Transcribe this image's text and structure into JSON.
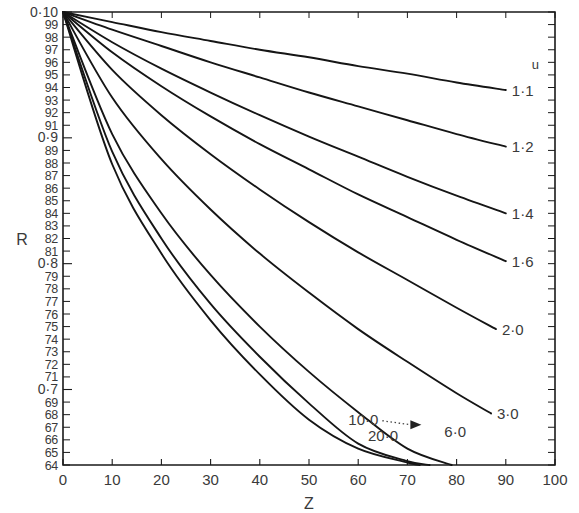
{
  "chart_data": {
    "type": "line",
    "title": "",
    "xlabel": "Z",
    "ylabel": "R",
    "xlim": [
      0,
      100
    ],
    "ylim": [
      0.64,
      1.0
    ],
    "grid": false,
    "legend_position": "inline-right",
    "x_ticks": [
      0,
      10,
      20,
      30,
      40,
      50,
      60,
      70,
      80,
      90,
      100
    ],
    "x_tick_labels": [
      "0",
      "10",
      "20",
      "30",
      "40",
      "50",
      "60",
      "70",
      "80",
      "90",
      "100"
    ],
    "y_ticks": [
      1.0,
      0.99,
      0.98,
      0.97,
      0.96,
      0.95,
      0.94,
      0.93,
      0.92,
      0.91,
      0.9,
      0.89,
      0.88,
      0.87,
      0.86,
      0.85,
      0.84,
      0.83,
      0.82,
      0.81,
      0.8,
      0.79,
      0.78,
      0.77,
      0.76,
      0.75,
      0.74,
      0.73,
      0.72,
      0.71,
      0.7,
      0.69,
      0.68,
      0.67,
      0.66,
      0.65,
      0.64
    ],
    "y_tick_labels": [
      "0·10",
      "99",
      "98",
      "97",
      "96",
      "95",
      "94",
      "93",
      "92",
      "91",
      "0·9",
      "89",
      "88",
      "87",
      "86",
      "85",
      "84",
      "83",
      "82",
      "81",
      "0·8",
      "79",
      "78",
      "77",
      "76",
      "75",
      "74",
      "73",
      "72",
      "71",
      "0·7",
      "69",
      "68",
      "67",
      "66",
      "65",
      "64"
    ],
    "series_param_name": "u",
    "series": [
      {
        "name": "1·1",
        "label_position": "right",
        "points": [
          [
            0,
            1.0
          ],
          [
            10,
            0.992
          ],
          [
            20,
            0.984
          ],
          [
            30,
            0.977
          ],
          [
            40,
            0.97
          ],
          [
            50,
            0.964
          ],
          [
            60,
            0.957
          ],
          [
            70,
            0.951
          ],
          [
            80,
            0.944
          ],
          [
            90,
            0.938
          ]
        ]
      },
      {
        "name": "1·2",
        "label_position": "right",
        "points": [
          [
            0,
            1.0
          ],
          [
            10,
            0.986
          ],
          [
            20,
            0.973
          ],
          [
            30,
            0.96
          ],
          [
            40,
            0.948
          ],
          [
            50,
            0.936
          ],
          [
            60,
            0.925
          ],
          [
            70,
            0.914
          ],
          [
            80,
            0.903
          ],
          [
            90,
            0.893
          ]
        ]
      },
      {
        "name": "1·4",
        "label_position": "right",
        "points": [
          [
            0,
            1.0
          ],
          [
            10,
            0.976
          ],
          [
            20,
            0.955
          ],
          [
            30,
            0.936
          ],
          [
            40,
            0.918
          ],
          [
            50,
            0.901
          ],
          [
            60,
            0.885
          ],
          [
            70,
            0.869
          ],
          [
            80,
            0.854
          ],
          [
            90,
            0.84
          ]
        ]
      },
      {
        "name": "1·6",
        "label_position": "right",
        "points": [
          [
            0,
            1.0
          ],
          [
            10,
            0.968
          ],
          [
            20,
            0.941
          ],
          [
            30,
            0.917
          ],
          [
            40,
            0.895
          ],
          [
            50,
            0.875
          ],
          [
            60,
            0.855
          ],
          [
            70,
            0.837
          ],
          [
            80,
            0.819
          ],
          [
            90,
            0.802
          ]
        ]
      },
      {
        "name": "2·0",
        "label_position": "right",
        "points": [
          [
            0,
            1.0
          ],
          [
            10,
            0.954
          ],
          [
            20,
            0.918
          ],
          [
            30,
            0.887
          ],
          [
            40,
            0.859
          ],
          [
            50,
            0.833
          ],
          [
            60,
            0.809
          ],
          [
            70,
            0.787
          ],
          [
            80,
            0.765
          ],
          [
            88,
            0.748
          ]
        ]
      },
      {
        "name": "3·0",
        "label_position": "right",
        "points": [
          [
            0,
            1.0
          ],
          [
            10,
            0.932
          ],
          [
            20,
            0.883
          ],
          [
            30,
            0.843
          ],
          [
            40,
            0.808
          ],
          [
            50,
            0.777
          ],
          [
            60,
            0.748
          ],
          [
            70,
            0.722
          ],
          [
            80,
            0.697
          ],
          [
            87,
            0.681
          ]
        ]
      },
      {
        "name": "6·0",
        "label_position": "below-right",
        "points": [
          [
            0,
            1.0
          ],
          [
            10,
            0.903
          ],
          [
            20,
            0.84
          ],
          [
            30,
            0.791
          ],
          [
            40,
            0.75
          ],
          [
            50,
            0.714
          ],
          [
            60,
            0.682
          ],
          [
            70,
            0.653
          ],
          [
            79,
            0.64
          ]
        ]
      },
      {
        "name": "10·0",
        "label_position": "leader-left",
        "points": [
          [
            0,
            1.0
          ],
          [
            10,
            0.889
          ],
          [
            20,
            0.82
          ],
          [
            30,
            0.768
          ],
          [
            40,
            0.726
          ],
          [
            50,
            0.689
          ],
          [
            60,
            0.657
          ],
          [
            70,
            0.643
          ],
          [
            74.5,
            0.64
          ]
        ]
      },
      {
        "name": "20·0",
        "label_position": "below-left",
        "points": [
          [
            0,
            1.0
          ],
          [
            10,
            0.879
          ],
          [
            20,
            0.808
          ],
          [
            30,
            0.755
          ],
          [
            40,
            0.712
          ],
          [
            50,
            0.676
          ],
          [
            60,
            0.653
          ],
          [
            70,
            0.642
          ],
          [
            72.5,
            0.64
          ]
        ]
      }
    ],
    "annotations": [
      {
        "text": "u",
        "role": "series-parameter-header",
        "x": 96,
        "y": 0.955
      },
      {
        "text": "10·0",
        "role": "leader-label",
        "x": 58,
        "y": 0.672
      },
      {
        "text": "20·0",
        "role": "curve-label",
        "x": 62,
        "y": 0.659
      },
      {
        "text": "6·0",
        "role": "curve-label",
        "x": 77.5,
        "y": 0.662
      }
    ]
  },
  "axes": {
    "x_title": "Z",
    "y_title": "R"
  }
}
